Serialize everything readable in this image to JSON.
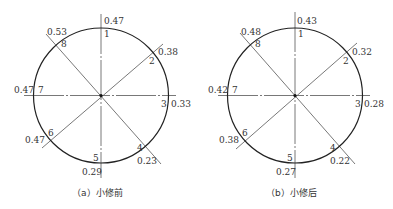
{
  "figures": [
    {
      "id": "a",
      "caption": "（a）小修前",
      "center": [
        101,
        95.5
      ],
      "radius": 67.5,
      "points": [
        {
          "label": "1",
          "value": "0.47",
          "angle": 90
        },
        {
          "label": "2",
          "value": "0.38",
          "angle": 45
        },
        {
          "label": "3",
          "value": "0.33",
          "angle": 0
        },
        {
          "label": "4",
          "value": "0.23",
          "angle": -45
        },
        {
          "label": "5",
          "value": "0.29",
          "angle": -90
        },
        {
          "label": "6",
          "value": "0.47",
          "angle": -135
        },
        {
          "label": "7",
          "value": "0.47",
          "angle": 180
        },
        {
          "label": "8",
          "value": "0.53",
          "angle": 135
        }
      ]
    },
    {
      "id": "b",
      "caption": "（b）小修后",
      "center": [
        295,
        95.5
      ],
      "radius": 67.5,
      "points": [
        {
          "label": "1",
          "value": "0.43",
          "angle": 90
        },
        {
          "label": "2",
          "value": "0.32",
          "angle": 45
        },
        {
          "label": "3",
          "value": "0.28",
          "angle": 0
        },
        {
          "label": "4",
          "value": "0.22",
          "angle": -45
        },
        {
          "label": "5",
          "value": "0.27",
          "angle": -90
        },
        {
          "label": "6",
          "value": "0.38",
          "angle": -135
        },
        {
          "label": "7",
          "value": "0.42",
          "angle": 180
        },
        {
          "label": "8",
          "value": "0.48",
          "angle": 135
        }
      ]
    }
  ],
  "colors": {
    "circle": "#222222",
    "line": "#555555",
    "text": "#333333"
  }
}
